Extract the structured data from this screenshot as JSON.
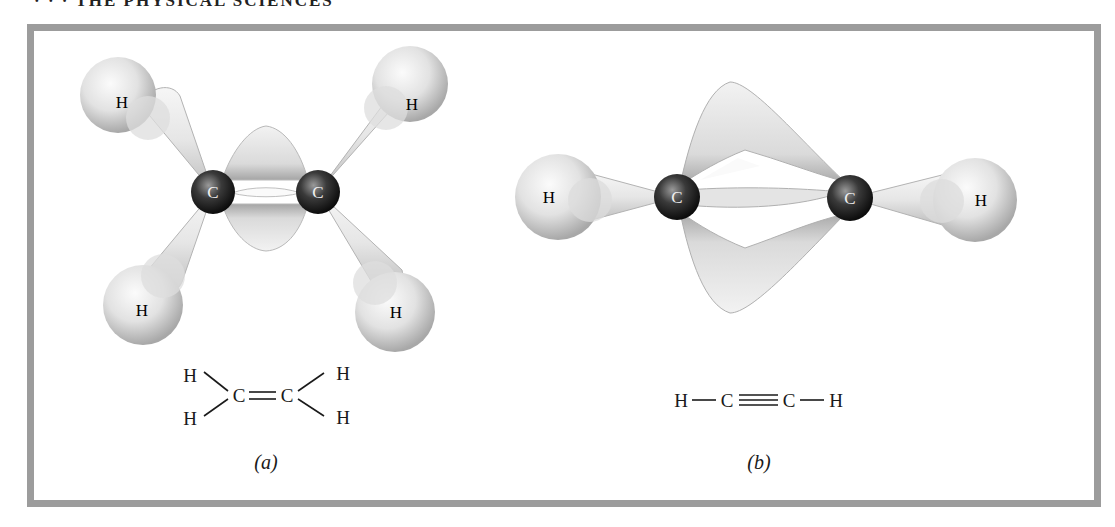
{
  "page": {
    "running_head": "· · ·  THE PHYSICAL SCIENCES"
  },
  "figure": {
    "colors": {
      "frame": "#9c9c9c",
      "orbital_light": "#f4f4f4",
      "orbital_mid": "#d4d4d4",
      "orbital_dark": "#9a9a9a",
      "carbon_light": "#8a8a8a",
      "carbon_dark": "#111111"
    },
    "panel_a": {
      "caption": "(a)",
      "molecule": "ethylene",
      "atoms": {
        "c_left": "C",
        "c_right": "C",
        "h_upper_left": "H",
        "h_upper_right": "H",
        "h_lower_left": "H",
        "h_lower_right": "H"
      },
      "formula": {
        "h_tl": "H",
        "h_bl": "H",
        "c1": "C",
        "double_bond": "═",
        "c2": "C",
        "h_tr": "H",
        "h_br": "H"
      }
    },
    "panel_b": {
      "caption": "(b)",
      "molecule": "acetylene",
      "atoms": {
        "h_left": "H",
        "c_left": "C",
        "c_right": "C",
        "h_right": "H"
      },
      "formula": {
        "h1": "H",
        "c1": "C",
        "c2": "C",
        "h2": "H"
      }
    }
  }
}
